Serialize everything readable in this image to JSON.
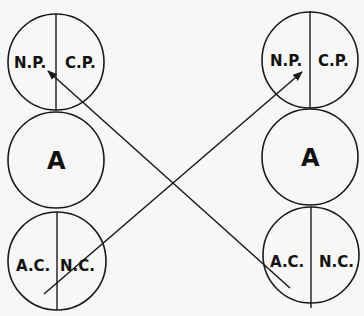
{
  "diagram": {
    "left_column": {
      "top": {
        "left_label": "N.P.",
        "right_label": "C.P."
      },
      "middle": {
        "label": "A"
      },
      "bottom": {
        "left_label": "A.C.",
        "right_label": "N.C."
      }
    },
    "right_column": {
      "top": {
        "left_label": "N.P.",
        "right_label": "C.P."
      },
      "middle": {
        "label": "A"
      },
      "bottom": {
        "left_label": "A.C.",
        "right_label": "N.C."
      }
    },
    "arrows": [
      {
        "from": "right_column.bottom.A.C.",
        "to": "left_column.top.N.P."
      },
      {
        "from": "left_column.bottom.A.C.",
        "to": "right_column.top.N.P."
      }
    ],
    "colors": {
      "stroke": "#1a1a1a",
      "background": "#f7f7f5"
    }
  }
}
